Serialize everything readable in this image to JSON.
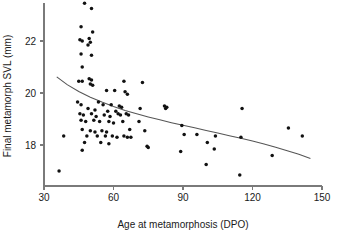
{
  "chart_data": {
    "type": "scatter",
    "title": "",
    "xlabel": "Age at metamorphosis (DPO)",
    "ylabel": "Final metamorph SVL (mm)",
    "xlim": [
      30,
      150
    ],
    "ylim": [
      16.5,
      23.6
    ],
    "xticks": [
      30,
      60,
      90,
      120,
      150
    ],
    "yticks": [
      18,
      20,
      22
    ],
    "xtick_labels": [
      "30",
      "60",
      "90",
      "120",
      "150"
    ],
    "ytick_labels": [
      "18",
      "20",
      "22"
    ],
    "grid": false,
    "legend": null,
    "point_color": "#111111",
    "curve_color": "#555555",
    "axis_color": "#7a7a7a",
    "n_points": 85,
    "points": [
      [
        47.5,
        23.45
      ],
      [
        50.5,
        23.25
      ],
      [
        46.0,
        22.55
      ],
      [
        51.0,
        22.35
      ],
      [
        45.5,
        22.05
      ],
      [
        46.5,
        22.0
      ],
      [
        49.5,
        22.1
      ],
      [
        50.0,
        21.95
      ],
      [
        49.0,
        21.85
      ],
      [
        46.0,
        21.5
      ],
      [
        50.5,
        21.45
      ],
      [
        46.5,
        21.0
      ],
      [
        45.0,
        20.45
      ],
      [
        46.5,
        20.45
      ],
      [
        49.5,
        20.55
      ],
      [
        50.5,
        20.5
      ],
      [
        50.0,
        20.35
      ],
      [
        51.0,
        20.3
      ],
      [
        64.5,
        20.45
      ],
      [
        72.5,
        20.4
      ],
      [
        57.0,
        20.1
      ],
      [
        60.5,
        20.1
      ],
      [
        65.0,
        20.05
      ],
      [
        66.0,
        19.95
      ],
      [
        44.5,
        19.65
      ],
      [
        46.0,
        19.55
      ],
      [
        53.5,
        19.65
      ],
      [
        55.5,
        19.55
      ],
      [
        59.0,
        19.55
      ],
      [
        62.5,
        19.5
      ],
      [
        63.5,
        19.45
      ],
      [
        49.0,
        19.4
      ],
      [
        52.0,
        19.35
      ],
      [
        57.5,
        19.3
      ],
      [
        61.0,
        19.3
      ],
      [
        71.5,
        19.4
      ],
      [
        82.0,
        19.5
      ],
      [
        82.5,
        19.4
      ],
      [
        83.0,
        19.45
      ],
      [
        115.5,
        19.4
      ],
      [
        45.5,
        19.2
      ],
      [
        47.0,
        19.15
      ],
      [
        50.5,
        19.2
      ],
      [
        52.5,
        19.1
      ],
      [
        56.0,
        19.15
      ],
      [
        58.5,
        19.1
      ],
      [
        62.0,
        19.2
      ],
      [
        63.0,
        19.15
      ],
      [
        65.5,
        19.2
      ],
      [
        66.5,
        19.15
      ],
      [
        46.0,
        18.95
      ],
      [
        48.0,
        18.9
      ],
      [
        51.5,
        18.95
      ],
      [
        54.0,
        18.9
      ],
      [
        58.0,
        18.9
      ],
      [
        60.0,
        18.85
      ],
      [
        64.0,
        18.9
      ],
      [
        71.0,
        18.9
      ],
      [
        89.5,
        18.75
      ],
      [
        46.5,
        18.6
      ],
      [
        50.0,
        18.55
      ],
      [
        52.0,
        18.5
      ],
      [
        55.0,
        18.55
      ],
      [
        57.0,
        18.5
      ],
      [
        67.0,
        18.6
      ],
      [
        73.5,
        18.55
      ],
      [
        135.5,
        18.65
      ],
      [
        38.5,
        18.35
      ],
      [
        48.5,
        18.35
      ],
      [
        53.0,
        18.35
      ],
      [
        56.5,
        18.35
      ],
      [
        59.5,
        18.35
      ],
      [
        61.5,
        18.3
      ],
      [
        64.5,
        18.35
      ],
      [
        66.0,
        18.3
      ],
      [
        67.5,
        18.3
      ],
      [
        90.5,
        18.4
      ],
      [
        96.0,
        18.4
      ],
      [
        104.0,
        18.35
      ],
      [
        115.0,
        18.3
      ],
      [
        141.5,
        18.35
      ],
      [
        47.5,
        18.1
      ],
      [
        54.5,
        18.1
      ],
      [
        58.0,
        18.05
      ],
      [
        74.5,
        17.95
      ],
      [
        75.0,
        17.9
      ],
      [
        100.5,
        18.1
      ],
      [
        103.5,
        17.85
      ],
      [
        46.5,
        17.8
      ],
      [
        89.0,
        17.75
      ],
      [
        128.5,
        17.6
      ],
      [
        100.0,
        17.25
      ],
      [
        36.5,
        17.0
      ],
      [
        114.5,
        16.85
      ]
    ],
    "fit_curve": {
      "description": "decaying fitted regression curve",
      "x_start": 35.5,
      "x_end": 145.0,
      "y_start": 20.62,
      "y_end": 17.48,
      "samples": [
        [
          35.5,
          20.62
        ],
        [
          40.0,
          20.32
        ],
        [
          45.0,
          20.06
        ],
        [
          50.0,
          19.84
        ],
        [
          55.0,
          19.65
        ],
        [
          60.0,
          19.48
        ],
        [
          65.0,
          19.33
        ],
        [
          70.0,
          19.2
        ],
        [
          75.0,
          19.08
        ],
        [
          80.0,
          18.97
        ],
        [
          85.0,
          18.86
        ],
        [
          90.0,
          18.76
        ],
        [
          95.0,
          18.66
        ],
        [
          100.0,
          18.56
        ],
        [
          105.0,
          18.46
        ],
        [
          110.0,
          18.36
        ],
        [
          115.0,
          18.26
        ],
        [
          120.0,
          18.15
        ],
        [
          125.0,
          18.04
        ],
        [
          130.0,
          17.91
        ],
        [
          135.0,
          17.78
        ],
        [
          140.0,
          17.64
        ],
        [
          145.0,
          17.48
        ]
      ]
    }
  },
  "figure": {
    "caption": ""
  }
}
